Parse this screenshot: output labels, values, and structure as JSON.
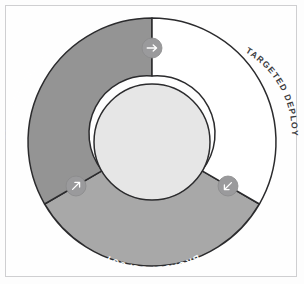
{
  "figure": {
    "canvas": {
      "width": 304,
      "height": 284
    },
    "background_color": "#fdfdfd",
    "frame_border_color": "#cfcfd1"
  },
  "diagram": {
    "type": "donut-cycle",
    "center": {
      "x": 152,
      "y": 142
    },
    "outer_radius": 124,
    "inner_radius": 58,
    "hub_color": "#e6e6e6",
    "outline_color": "#2b2b2d",
    "segments": [
      {
        "id": "plan-and-prepare",
        "label": "PLAN AND PREPARE",
        "fill": "#949494",
        "label_color": "#ffffff",
        "start_angle_deg": 210,
        "end_angle_deg": 270
      },
      {
        "id": "targeted-deploy",
        "label": "TARGETED DEPLOY",
        "fill": "#ffffff",
        "label_color": "#3c3c3e",
        "start_angle_deg": 270,
        "end_angle_deg": 330
      },
      {
        "id": "broadly-deploy",
        "label": "BROADLY DEPLOY",
        "fill": "#a8a8a8",
        "label_color": "#ffffff",
        "start_angle_deg": 330,
        "end_angle_deg": 210
      }
    ],
    "arrow_markers": [
      {
        "id": "arrow-top",
        "icon": "arrow-right-icon",
        "direction": "right",
        "x": 152,
        "y": 48,
        "radius": 10,
        "fill": "#9a9a9c",
        "glyph_color": "#ffffff"
      },
      {
        "id": "arrow-lower-left",
        "icon": "arrow-up-right-icon",
        "direction": "up-right",
        "x": 76,
        "y": 186,
        "radius": 10,
        "fill": "#9a9a9c",
        "glyph_color": "#ffffff"
      },
      {
        "id": "arrow-lower-right",
        "icon": "arrow-down-left-icon",
        "direction": "down-left",
        "x": 228,
        "y": 186,
        "radius": 10,
        "fill": "#9a9a9c",
        "glyph_color": "#ffffff"
      }
    ]
  }
}
